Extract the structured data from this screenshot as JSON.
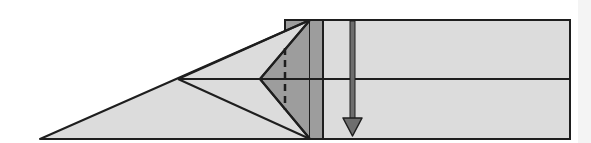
{
  "diagram": {
    "type": "origami-fold-step",
    "colors": {
      "paper_light": "#dcdcdc",
      "paper_dark": "#9d9d9d",
      "line": "#1e1e1e",
      "arrow_fill": "#6e6e6e",
      "background": "#ffffff"
    },
    "elements": {
      "rectangle": "main-paper-strip",
      "dark_strip": "folded-layer",
      "left_triangle": "pointed-flap",
      "dashed_line": "valley-fold-line",
      "arrow": "fold-direction-arrow-down"
    }
  }
}
